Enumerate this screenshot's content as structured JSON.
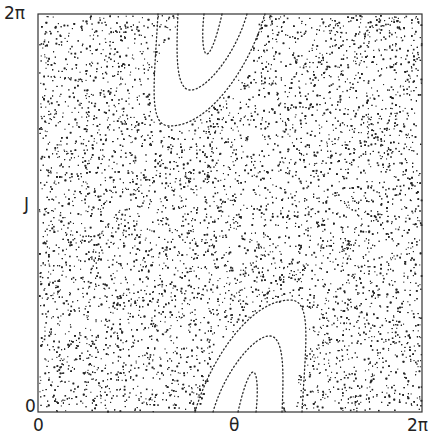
{
  "chart_data": {
    "type": "scatter",
    "title": "",
    "subtitle": "Poincaré surface of section (standard map): chaotic sea with two elliptic island chains",
    "xlabel": "θ",
    "ylabel": "J",
    "xlim": [
      0,
      6.2832
    ],
    "ylim": [
      0,
      6.2832
    ],
    "x_ticks": [
      "0",
      "2π"
    ],
    "y_ticks": [
      "0",
      "2π"
    ],
    "grid": false,
    "legend": null,
    "series": [
      {
        "name": "chaotic-sea",
        "kind": "random scatter filling domain except islands",
        "approx_points": 9000
      },
      {
        "name": "island-top",
        "kind": "nested invariant curves (3)",
        "center_approx": [
          2.9,
          5.9
        ]
      },
      {
        "name": "island-bottom",
        "kind": "nested invariant curves (3)",
        "center_approx": [
          3.9,
          0.4
        ]
      }
    ],
    "point_color": "#222222"
  },
  "labels": {
    "y_top": "2π",
    "y_bottom": "0",
    "y_axis": "J",
    "x_left": "0",
    "x_mid": "θ",
    "x_right": "2π"
  }
}
